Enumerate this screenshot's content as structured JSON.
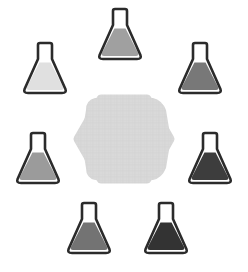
{
  "scene": {
    "title": "Flask Array Diagram",
    "background_color": "#ffffff",
    "width": 248,
    "height": 272,
    "layout": "hexagonal-ring",
    "item_count": 6
  },
  "center_shape": {
    "name": "hexagon-platform",
    "shape": "hexagon",
    "orientation": "pointy-left-right",
    "fill_color": "#d8d8d8",
    "texture": "fine-crosshatch",
    "corner_radius": 10,
    "center_x": 124,
    "center_y": 139,
    "width": 92,
    "height": 86,
    "label": ""
  },
  "flask_style": {
    "outline_color": "#2b2b2b",
    "outline_width": 2.6,
    "glass_color": "#ffffff",
    "neck_width": 14,
    "body_width": 44,
    "fill_top_ratio": 0.74
  },
  "flasks": [
    {
      "id": "flask-top",
      "position_label": "top",
      "x": 92,
      "y": 4,
      "fill_color": "#a0a0a0",
      "shade_level": 3,
      "liquid_level": 0.72
    },
    {
      "id": "flask-top-left",
      "position_label": "top-left",
      "x": 17,
      "y": 38,
      "fill_color": "#e0e0e0",
      "shade_level": 1,
      "liquid_level": 0.72
    },
    {
      "id": "flask-top-right",
      "position_label": "top-right",
      "x": 172,
      "y": 38,
      "fill_color": "#787878",
      "shade_level": 4,
      "liquid_level": 0.72
    },
    {
      "id": "flask-mid-left",
      "position_label": "middle-left",
      "x": 10,
      "y": 128,
      "fill_color": "#9b9b9b",
      "shade_level": 2,
      "liquid_level": 0.72
    },
    {
      "id": "flask-mid-right",
      "position_label": "middle-right",
      "x": 182,
      "y": 128,
      "fill_color": "#3d3d3d",
      "shade_level": 6,
      "liquid_level": 0.72
    },
    {
      "id": "flask-bottom-left",
      "position_label": "bottom-left",
      "x": 61,
      "y": 198,
      "fill_color": "#737373",
      "shade_level": 5,
      "liquid_level": 0.72
    },
    {
      "id": "flask-bottom-right",
      "position_label": "bottom-right",
      "x": 138,
      "y": 198,
      "fill_color": "#333333",
      "shade_level": 7,
      "liquid_level": 0.72
    }
  ]
}
